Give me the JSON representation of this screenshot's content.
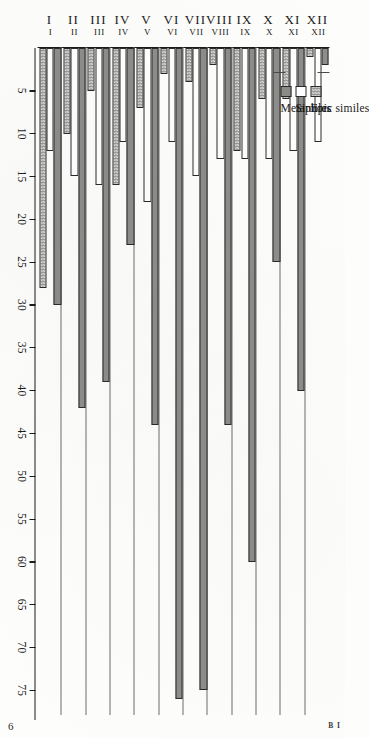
{
  "page": {
    "folio": "6",
    "running_head": "B I"
  },
  "legend": {
    "title": "",
    "items": [
      {
        "label": "Epic similes",
        "swatch": "epic",
        "color": "#d8d8d4"
      },
      {
        "label": "Similes",
        "swatch": "simile",
        "color": "#ffffff"
      },
      {
        "label": "Metaphors",
        "swatch": "metaphor",
        "color": "#8b8b88"
      }
    ]
  },
  "axis": {
    "tick_labels": [
      "75",
      "70",
      "65",
      "60",
      "55",
      "50",
      "45",
      "40",
      "35",
      "30",
      "25",
      "20",
      "15",
      "10",
      "5"
    ],
    "tick_values": [
      75,
      70,
      65,
      60,
      55,
      50,
      45,
      40,
      35,
      30,
      25,
      20,
      15,
      10,
      5
    ]
  },
  "chart_data": {
    "type": "bar",
    "orientation": "horizontal",
    "title": "",
    "subtitle": "",
    "xlabel": "",
    "ylabel": "",
    "categories": [
      "I",
      "II",
      "III",
      "IV",
      "V",
      "VI",
      "VII",
      "VIII",
      "IX",
      "X",
      "XI",
      "XII"
    ],
    "series": [
      {
        "name": "Epic similes",
        "color": "#d8d8d4",
        "values": [
          28,
          10,
          5,
          16,
          7,
          3,
          4,
          2,
          12,
          6,
          6,
          1
        ]
      },
      {
        "name": "Similes",
        "color": "#ffffff",
        "values": [
          12,
          15,
          16,
          11,
          18,
          11,
          15,
          13,
          13,
          13,
          12,
          11
        ]
      },
      {
        "name": "Metaphors",
        "color": "#8b8b88",
        "values": [
          30,
          42,
          39,
          23,
          44,
          76,
          75,
          44,
          60,
          25,
          40,
          2
        ]
      }
    ],
    "xlim": [
      0,
      78
    ],
    "grid": false,
    "legend_position": "top-left"
  }
}
